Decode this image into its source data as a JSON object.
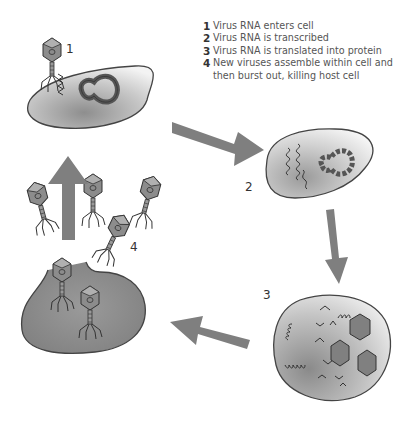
{
  "legend": {
    "items": [
      {
        "num": "1",
        "text": "Virus RNA enters cell"
      },
      {
        "num": "2",
        "text": "Virus RNA is transcribed"
      },
      {
        "num": "3",
        "text": "Virus RNA is translated into protein"
      },
      {
        "num": "4",
        "text": "New viruses assemble within cell and then burst out, killing host cell"
      }
    ]
  },
  "steps": {
    "step1": {
      "label": "1"
    },
    "step2": {
      "label": "2"
    },
    "step3": {
      "label": "3"
    },
    "step4": {
      "label": "4"
    }
  },
  "colors": {
    "arrow": "#7f7f7f",
    "cell_outline": "#444444",
    "cell_light": "#f2f2f2",
    "cell_dark": "#8c8c8c",
    "virus": "#8a8a8a",
    "text": "#555555"
  }
}
